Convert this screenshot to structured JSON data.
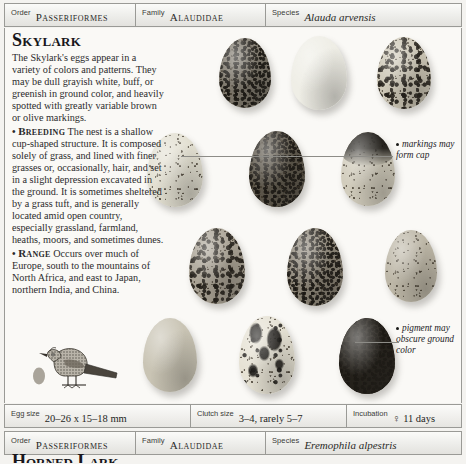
{
  "page": {
    "background_color": "#f4f3f0",
    "rule_color": "#9a9a96"
  },
  "taxonomy_header_top": {
    "order": {
      "label": "Order",
      "value": "Passeriformes"
    },
    "family": {
      "label": "Family",
      "value": "Alaudidae"
    },
    "species": {
      "label": "Species",
      "value": "Alauda arvensis"
    }
  },
  "taxonomy_header_bottom": {
    "order": {
      "label": "Order",
      "value": "Passeriformes"
    },
    "family": {
      "label": "Family",
      "value": "Alaudidae"
    },
    "species": {
      "label": "Species",
      "value": "Eremophila alpestris"
    }
  },
  "article": {
    "headline": "Skylark",
    "intro": "The Skylark's eggs appear in a variety of colors and patterns. They may be dull grayish white, buff, or greenish in ground color, and heavily spotted with greatly variable brown or olive markings.",
    "sections": [
      {
        "bullet": "•",
        "heading": "Breeding",
        "text": "The nest is a shallow cup-shaped structure. It is composed solely of grass, and lined with finer grasses or, occasionally, hair, and set in a slight depression excavated in the ground. It is sometimes sheltered by a grass tuft, and is generally located amid open country, especially grassland, farmland, heaths, moors, and sometimes dunes."
      },
      {
        "bullet": "•",
        "heading": "Range",
        "text": "Occurs over much of Europe, south to the mountains of North Africa, and east to Japan, northern India, and China."
      }
    ]
  },
  "callouts": [
    {
      "name": "markings-cap-callout",
      "text": "markings may form cap"
    },
    {
      "name": "pigment-obscure-callout",
      "text": "pigment may obscure ground color"
    }
  ],
  "egg_plate": {
    "caption_alt": "Skylark egg variation plate",
    "rows": [
      {
        "eggs": [
          {
            "id": "egg-1",
            "tone": "#7d776b",
            "pattern": "fine-dense",
            "w": 52,
            "h": 70,
            "x": 218,
            "y": 38
          },
          {
            "id": "egg-2",
            "tone": "#efeee6",
            "pattern": "plain",
            "w": 56,
            "h": 74,
            "x": 290,
            "y": 36
          },
          {
            "id": "egg-3",
            "tone": "#cdc7b6",
            "pattern": "heavy-blotch",
            "w": 54,
            "h": 72,
            "x": 376,
            "y": 37
          }
        ]
      },
      {
        "eggs": [
          {
            "id": "egg-4",
            "tone": "#e3e0d2",
            "pattern": "fine-sparse",
            "w": 56,
            "h": 74,
            "x": 146,
            "y": 133
          },
          {
            "id": "egg-5",
            "tone": "#5d574b",
            "pattern": "dense-dark",
            "w": 56,
            "h": 76,
            "x": 248,
            "y": 131
          },
          {
            "id": "egg-6",
            "tone": "#d2cdbd",
            "pattern": "dark-cap",
            "w": 54,
            "h": 74,
            "x": 340,
            "y": 132
          }
        ]
      },
      {
        "eggs": [
          {
            "id": "egg-7",
            "tone": "#a9a294",
            "pattern": "heavy-blotch",
            "w": 56,
            "h": 76,
            "x": 188,
            "y": 228
          },
          {
            "id": "egg-8",
            "tone": "#8d8678",
            "pattern": "dense-dark",
            "w": 56,
            "h": 78,
            "x": 286,
            "y": 228
          },
          {
            "id": "egg-9",
            "tone": "#bdb7a7",
            "pattern": "fine-sparse",
            "w": 52,
            "h": 72,
            "x": 384,
            "y": 230
          }
        ]
      },
      {
        "eggs": [
          {
            "id": "egg-10",
            "tone": "#c9c4b4",
            "pattern": "plain",
            "w": 54,
            "h": 74,
            "x": 142,
            "y": 318
          },
          {
            "id": "egg-11",
            "tone": "#e6e2d4",
            "pattern": "bold-blotch",
            "w": 56,
            "h": 78,
            "x": 238,
            "y": 316
          },
          {
            "id": "egg-12",
            "tone": "#413b32",
            "pattern": "dark-wash",
            "w": 56,
            "h": 76,
            "x": 338,
            "y": 318
          }
        ]
      }
    ]
  },
  "bird_vignette": {
    "name": "skylark-bird-illustration",
    "scale_egg_label": "egg at actual size"
  },
  "data_strip": {
    "egg_size": {
      "label": "Egg size",
      "value": "20–26 x 15–18 mm"
    },
    "clutch_size": {
      "label": "Clutch size",
      "value": "3–4, rarely 5–7"
    },
    "incubation": {
      "label": "Incubation",
      "value": "♀ 11 days"
    }
  },
  "next_entry": {
    "headline_partial": "Horned Lark"
  }
}
